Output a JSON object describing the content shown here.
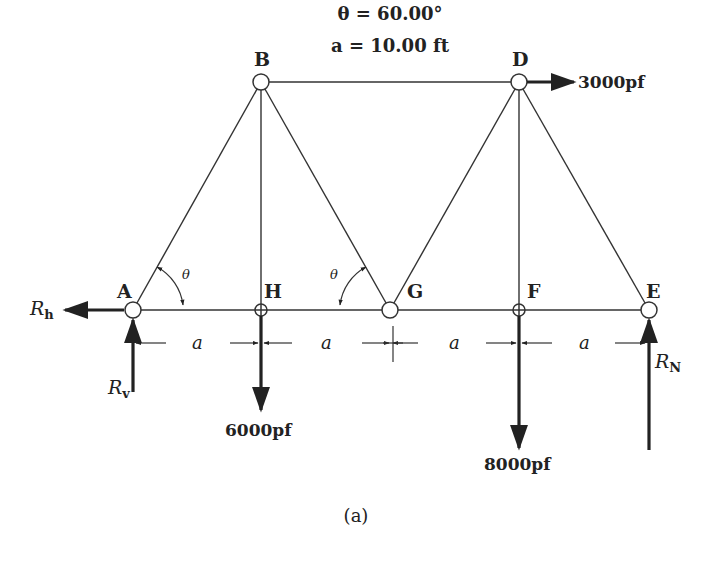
{
  "parameters": {
    "theta_line": "θ = 60.00°",
    "a_line": "a = 10.00 ft"
  },
  "nodes": {
    "A": "A",
    "B": "B",
    "D": "D",
    "E": "E",
    "F": "F",
    "G": "G",
    "H": "H"
  },
  "loads": {
    "D_horizontal": "3000pf",
    "H_vertical": "6000pf",
    "F_vertical": "8000pf"
  },
  "reactions": {
    "Rh_main": "R",
    "Rh_sub": "h",
    "Rv_main": "R",
    "Rv_sub": "v",
    "RN_main": "R",
    "RN_sub": "N"
  },
  "dimensions": {
    "span_label": "a",
    "angle_label": "θ"
  },
  "caption": "(a)"
}
